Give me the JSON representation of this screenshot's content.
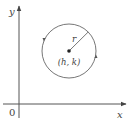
{
  "diagram": {
    "type": "circle-on-coordinate-plane",
    "axes": {
      "x_label": "x",
      "y_label": "y",
      "origin_label": "0"
    },
    "circle": {
      "center_label": "(h, k)",
      "radius_label": "r",
      "orientation": "counterclockwise"
    },
    "colors": {
      "stroke": "#555555",
      "text": "#444444",
      "background": "#ffffff"
    }
  }
}
